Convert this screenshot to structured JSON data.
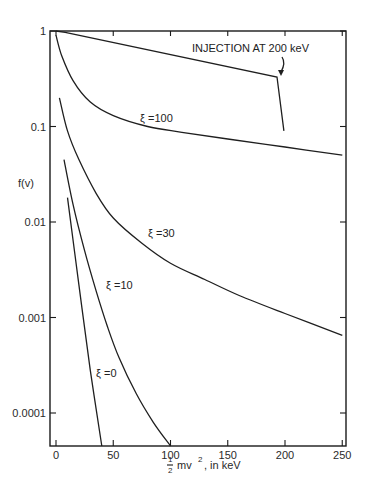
{
  "chart_data": {
    "type": "line",
    "title": "",
    "xlabel": "½ mv², in keV",
    "ylabel": "f(v)",
    "xscale": "linear",
    "yscale": "log",
    "xlim": [
      0,
      250
    ],
    "ylim": [
      4.5e-05,
      1
    ],
    "x_ticks": [
      0,
      50,
      100,
      150,
      200,
      250
    ],
    "x_tick_labels": [
      "0",
      "50",
      "100",
      "150",
      "200",
      "250"
    ],
    "y_ticks": [
      1,
      0.1,
      0.01,
      0.001,
      0.0001
    ],
    "y_tick_labels": [
      "1",
      "0.1",
      "0.01",
      "0.001",
      "0.0001"
    ],
    "grid": false,
    "legend": "none (curves labeled inline)",
    "series": [
      {
        "name": "Injection at 200 keV",
        "label": "INJECTION AT 200 keV",
        "x": [
          0,
          8,
          193,
          199
        ],
        "y": [
          1.0,
          0.97,
          0.33,
          0.09
        ]
      },
      {
        "name": "ξ=100",
        "label": "ξ =100",
        "x": [
          0,
          5,
          15,
          30,
          50,
          80,
          110,
          150,
          200,
          250
        ],
        "y": [
          0.9,
          0.55,
          0.3,
          0.18,
          0.13,
          0.1,
          0.087,
          0.074,
          0.061,
          0.05
        ]
      },
      {
        "name": "ξ=30",
        "label": "ξ =30",
        "x": [
          3,
          10,
          20,
          35,
          50,
          75,
          100,
          130,
          160,
          200,
          250
        ],
        "y": [
          0.2,
          0.09,
          0.045,
          0.02,
          0.011,
          0.006,
          0.0037,
          0.0025,
          0.0017,
          0.0011,
          0.00065
        ]
      },
      {
        "name": "ξ=10",
        "label": "ξ =10",
        "x": [
          7,
          15,
          25,
          35,
          45,
          55,
          70,
          85,
          100
        ],
        "y": [
          0.045,
          0.015,
          0.005,
          0.0019,
          0.0008,
          0.00038,
          0.00016,
          8e-05,
          4.5e-05
        ]
      },
      {
        "name": "ξ=0",
        "label": "ξ =0",
        "x": [
          10,
          20,
          30,
          40
        ],
        "y": [
          0.018,
          0.0022,
          0.00028,
          4.5e-05
        ]
      }
    ],
    "annotations": [
      {
        "text": "INJECTION AT 200 keV",
        "arrow_to": [
          198,
          0.33
        ]
      }
    ]
  },
  "labels": {
    "ylabel": "f(v)",
    "xlabel_frac_num": "1",
    "xlabel_frac_den": "2",
    "xlabel_rest": "mv",
    "xlabel_sup": "2",
    "xlabel_tail": ", in keV",
    "injection": "INJECTION AT 200 keV",
    "xi100": "ξ =100",
    "xi30": "ξ =30",
    "xi10": "ξ =10",
    "xi0": "ξ =0"
  }
}
